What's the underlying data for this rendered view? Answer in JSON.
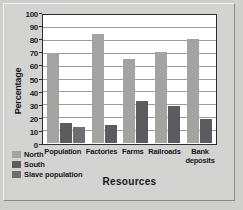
{
  "chart_data": {
    "type": "bar",
    "title": "",
    "xlabel": "Resources",
    "ylabel": "Percentage",
    "categories": [
      "Population",
      "Factories",
      "Farms",
      "Railroads",
      "Bank deposits"
    ],
    "series": [
      {
        "name": "North",
        "color": "#a3a3a1",
        "values": [
          71,
          86,
          66,
          72,
          82
        ]
      },
      {
        "name": "South",
        "color": "#5c5c5e",
        "values": [
          16,
          14,
          33,
          29,
          19
        ]
      },
      {
        "name": "Slave population",
        "color": "#6e6e70",
        "values": [
          13,
          null,
          null,
          null,
          null
        ]
      }
    ],
    "ylim": [
      0,
      100
    ],
    "yticks": [
      0,
      10,
      20,
      30,
      40,
      50,
      60,
      70,
      80,
      90,
      100
    ],
    "ytick_labels": [
      "0",
      "10",
      "20",
      "30",
      "40",
      "50",
      "60",
      "70",
      "80",
      "90",
      "100"
    ],
    "grid": true,
    "legend_position": "bottom-left"
  }
}
